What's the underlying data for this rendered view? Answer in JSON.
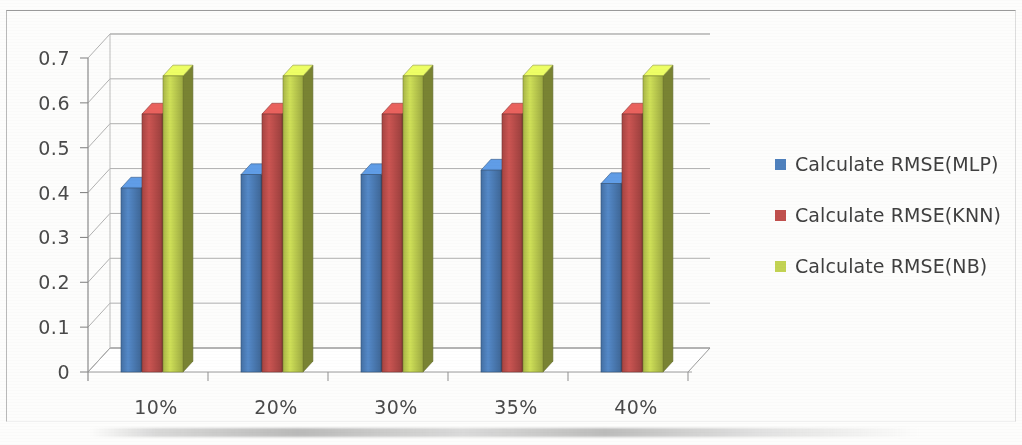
{
  "chart_data": {
    "type": "bar",
    "title": "",
    "subtitle": "",
    "xlabel": "",
    "ylabel": "",
    "categories": [
      "10%",
      "20%",
      "30%",
      "35%",
      "40%"
    ],
    "series": [
      {
        "name": "Calculate RMSE(MLP)",
        "color": "#4f81bd",
        "values": [
          0.41,
          0.44,
          0.44,
          0.45,
          0.42
        ]
      },
      {
        "name": "Calculate RMSE(KNN)",
        "color": "#c0504d",
        "values": [
          0.575,
          0.575,
          0.575,
          0.575,
          0.575
        ]
      },
      {
        "name": "Calculate RMSE(NB)",
        "color": "#c3d353",
        "values": [
          0.66,
          0.66,
          0.66,
          0.66,
          0.66
        ]
      }
    ],
    "ylim": [
      0,
      0.7
    ],
    "yticks": [
      0,
      0.1,
      0.2,
      0.3,
      0.4,
      0.5,
      0.6,
      0.7
    ],
    "ytick_labels": [
      "0",
      "0.1",
      "0.2",
      "0.3",
      "0.4",
      "0.5",
      "0.6",
      "0.7"
    ],
    "grid": true,
    "grid_axis": "y",
    "legend_position": "right",
    "three_d": true,
    "annotations": []
  },
  "legend": {
    "items": [
      {
        "label": "Calculate RMSE(MLP)",
        "color": "#4f81bd"
      },
      {
        "label": "Calculate RMSE(KNN)",
        "color": "#c0504d"
      },
      {
        "label": "Calculate RMSE(NB)",
        "color": "#c3d353"
      }
    ]
  },
  "colors": {
    "series_mlp": "#4f81bd",
    "series_knn": "#c0504d",
    "series_nb": "#c3d353",
    "grid": "#9a9a9a",
    "axis": "#8a8a8a",
    "text": "#4a4a4a",
    "background": "#fdfdfc"
  }
}
